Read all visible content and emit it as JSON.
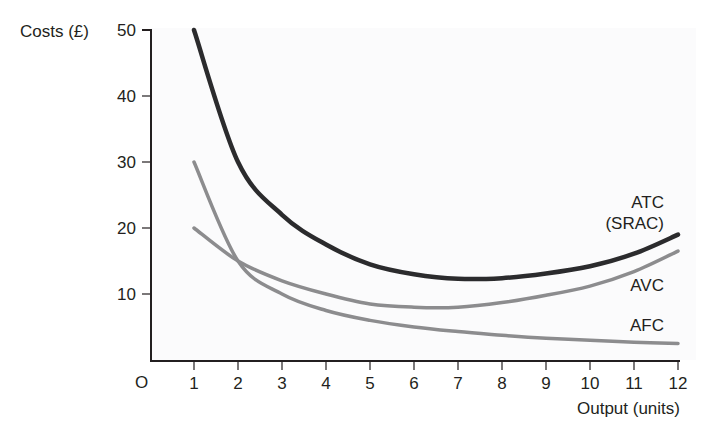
{
  "chart_data": {
    "type": "line",
    "title": "",
    "xlabel": "Output (units)",
    "ylabel": "Costs (£)",
    "origin_label": "O",
    "x": [
      1,
      2,
      3,
      4,
      5,
      6,
      7,
      8,
      9,
      10,
      11,
      12
    ],
    "x_ticks": [
      "1",
      "2",
      "3",
      "4",
      "5",
      "6",
      "7",
      "8",
      "9",
      "10",
      "11",
      "12"
    ],
    "y_ticks": [
      "10",
      "20",
      "30",
      "40",
      "50"
    ],
    "xlim": [
      0,
      12
    ],
    "ylim": [
      0,
      50
    ],
    "grid": false,
    "legend": "inline labels at right end of curves",
    "series": [
      {
        "name": "ATC (SRAC)",
        "label_lines": [
          "ATC",
          "(SRAC)"
        ],
        "color": "#2b2b2d",
        "width": 4.5,
        "values": [
          50,
          30,
          22,
          17.5,
          14.5,
          13,
          12.3,
          12.4,
          13.1,
          14.2,
          16.1,
          19
        ]
      },
      {
        "name": "AVC",
        "label_lines": [
          "AVC"
        ],
        "color": "#8c8c8e",
        "width": 3.5,
        "values": [
          20,
          15,
          12,
          10,
          8.5,
          8,
          8,
          8.7,
          9.8,
          11.2,
          13.4,
          16.5
        ]
      },
      {
        "name": "AFC",
        "label_lines": [
          "AFC"
        ],
        "color": "#8c8c8e",
        "width": 3.5,
        "values": [
          30,
          15,
          10,
          7.5,
          6,
          5,
          4.3,
          3.75,
          3.3,
          3,
          2.7,
          2.5
        ]
      }
    ]
  }
}
